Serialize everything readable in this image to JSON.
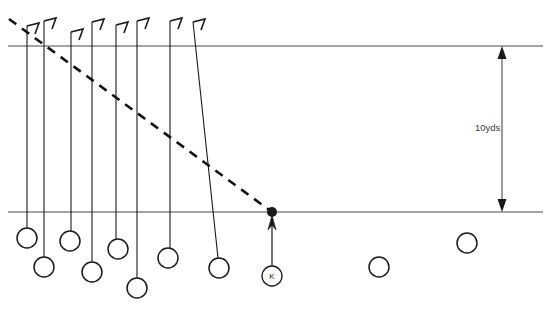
{
  "diagram": {
    "measurement_label": "10yds",
    "kicker_label": "K",
    "colors": {
      "line": "#1a1a1a",
      "field_line": "#4a4a4a",
      "dashed_line": "#111111",
      "player_circle": "#1a1a1a",
      "text": "#3a3a3a",
      "background": "#ffffff"
    },
    "field_lines": [
      {
        "name": "top-yard-line",
        "y": 46,
        "x1": 8,
        "x2": 543
      },
      {
        "name": "bottom-yard-line",
        "y": 212,
        "x1": 8,
        "x2": 543
      }
    ],
    "dimension_arrow": {
      "name": "ten-yard-dimension",
      "x": 502,
      "y_top": 46,
      "y_bottom": 212,
      "label": "10yds"
    },
    "dashed_path": {
      "name": "dashed-coverage-path",
      "x1": 9,
      "y1": 19,
      "x2": 272,
      "y2": 212
    },
    "kick_spot": {
      "name": "kick-spot-dot",
      "x": 272,
      "y": 212,
      "radius": 5
    },
    "kicker": {
      "name": "kicker",
      "label": "K",
      "circle_x": 272,
      "circle_y": 276,
      "radius": 10,
      "arrow_from_y": 266,
      "arrow_to_y": 216
    },
    "player_paths": [
      {
        "name": "path-1",
        "x_top": 27,
        "y_top": 26,
        "x_bottom": 27,
        "y_bottom": 228,
        "flag": true
      },
      {
        "name": "path-2",
        "x_top": 44,
        "y_top": 21,
        "x_bottom": 44,
        "y_bottom": 257,
        "flag": true
      },
      {
        "name": "path-3",
        "x_top": 71,
        "y_top": 32,
        "x_bottom": 71,
        "y_bottom": 231,
        "flag": true
      },
      {
        "name": "path-4",
        "x_top": 92,
        "y_top": 22,
        "x_bottom": 92,
        "y_bottom": 262,
        "flag": true
      },
      {
        "name": "path-5",
        "x_top": 116,
        "y_top": 25,
        "x_bottom": 116,
        "y_bottom": 239,
        "flag": true
      },
      {
        "name": "path-6",
        "x_top": 137,
        "y_top": 21,
        "x_bottom": 137,
        "y_bottom": 278,
        "flag": true
      },
      {
        "name": "path-7",
        "x_top": 170,
        "y_top": 21,
        "x_bottom": 170,
        "y_bottom": 248,
        "flag": true
      },
      {
        "name": "path-8",
        "x_top": 193,
        "y_top": 22,
        "x_bottom": 218,
        "y_bottom": 258,
        "flag": true
      }
    ],
    "players": [
      {
        "name": "player-1",
        "cx": 27,
        "cy": 238,
        "r": 10
      },
      {
        "name": "player-2",
        "cx": 44,
        "cy": 267,
        "r": 10
      },
      {
        "name": "player-3",
        "cx": 70,
        "cy": 241,
        "r": 10
      },
      {
        "name": "player-4",
        "cx": 92,
        "cy": 272,
        "r": 10
      },
      {
        "name": "player-5",
        "cx": 118,
        "cy": 249,
        "r": 10
      },
      {
        "name": "player-6",
        "cx": 137,
        "cy": 288,
        "r": 10
      },
      {
        "name": "player-7",
        "cx": 168,
        "cy": 258,
        "r": 10
      },
      {
        "name": "player-8",
        "cx": 219,
        "cy": 268,
        "r": 10
      },
      {
        "name": "player-9",
        "cx": 379,
        "cy": 267,
        "r": 10
      },
      {
        "name": "player-10",
        "cx": 467,
        "cy": 243,
        "r": 10
      }
    ]
  }
}
